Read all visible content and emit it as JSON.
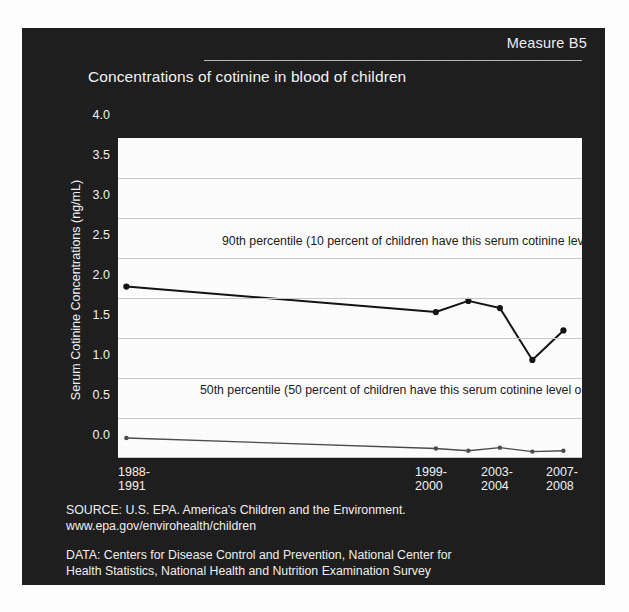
{
  "slide": {
    "measure_label": "Measure B5",
    "title": "Concentrations of cotinine in blood of children"
  },
  "footer": {
    "source": "SOURCE: U.S. EPA. America's Children and the Environment.\nwww.epa.gov/envirohealth/children",
    "data": "DATA: Centers for Disease Control and Prevention, National Center for\nHealth Statistics, National Health and Nutrition Examination Survey"
  },
  "annotations": {
    "p90": "90th percentile\n(10 percent of children have this\nserum cotinine level or greater)",
    "p90_line1": "90th percentile",
    "p90_line2": "(10 percent of children have this",
    "p90_line3": "serum cotinine level or greater)",
    "p50_line1": "50th percentile",
    "p50_line2": "(50 percent of children have this",
    "p50_line3": "serum cotinine level or greater)"
  },
  "colors": {
    "panel_bg": "#1c1c1c",
    "plot_bg": "#ffffff",
    "grid": "#c9c9c9",
    "p90_line": "#111111",
    "p50_line": "#4a4a4a",
    "text_light": "#f3f3f3",
    "text_dark": "#1a1a1a"
  },
  "chart_data": {
    "type": "line",
    "title": "Concentrations of cotinine in blood of children",
    "xlabel": "",
    "ylabel": "Serum Cotinine Concentrations (ng/mL)",
    "ylim": [
      0.0,
      4.0
    ],
    "yticks": [
      "0.0",
      "0.5",
      "1.0",
      "1.5",
      "2.0",
      "2.5",
      "3.0",
      "3.5",
      "4.0"
    ],
    "ytick_values": [
      0.0,
      0.5,
      1.0,
      1.5,
      2.0,
      2.5,
      3.0,
      3.5,
      4.0
    ],
    "grid": true,
    "legend": "annotations-inline",
    "xtick_labels": [
      {
        "line1": "1988-",
        "line2": "1991",
        "x_frac": 0.018
      },
      {
        "line1": "1999-",
        "line2": "2000",
        "x_frac": 0.685
      },
      {
        "line1": "2003-",
        "line2": "2004",
        "x_frac": 0.823
      },
      {
        "line1": "2007-",
        "line2": "2008",
        "x_frac": 0.96
      }
    ],
    "x": [
      0.018,
      0.685,
      0.755,
      0.823,
      0.893,
      0.96
    ],
    "series": [
      {
        "name": "90th percentile",
        "values": [
          2.15,
          1.83,
          1.97,
          1.88,
          1.23,
          1.6
        ]
      },
      {
        "name": "50th percentile",
        "values": [
          0.25,
          0.12,
          0.09,
          0.13,
          0.08,
          0.09
        ]
      }
    ]
  }
}
